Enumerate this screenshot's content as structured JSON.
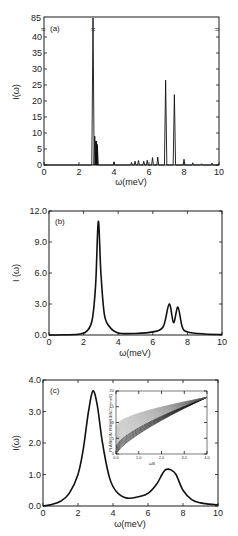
{
  "chart_data": [
    {
      "type": "line",
      "panel": "(a)",
      "xlabel": "ω(meV)",
      "ylabel": "I(ω)",
      "xlim": [
        0,
        10
      ],
      "ylim": [
        0,
        45
      ],
      "y_break": {
        "display_top": "85",
        "break_symbol": "≈",
        "break_at_x": [
          0,
          2.8,
          10
        ]
      },
      "xticks": [
        "0",
        "2",
        "4",
        "6",
        "8",
        "10"
      ],
      "yticks": [
        "0",
        "5",
        "10",
        "15",
        "20",
        "25",
        "30",
        "35",
        "40"
      ],
      "ytick_top_label": "85",
      "grid": false,
      "peaks": [
        {
          "x": 2.8,
          "y": 85
        },
        {
          "x": 2.9,
          "y": 9
        },
        {
          "x": 3.0,
          "y": 7.5
        },
        {
          "x": 3.05,
          "y": 6
        },
        {
          "x": 4.0,
          "y": 1
        },
        {
          "x": 5.0,
          "y": 0.8
        },
        {
          "x": 5.2,
          "y": 1.2
        },
        {
          "x": 5.4,
          "y": 1.4
        },
        {
          "x": 5.7,
          "y": 1.2
        },
        {
          "x": 5.9,
          "y": 1.5
        },
        {
          "x": 6.2,
          "y": 2.3
        },
        {
          "x": 6.5,
          "y": 2.5
        },
        {
          "x": 6.95,
          "y": 26.5
        },
        {
          "x": 7.45,
          "y": 22
        },
        {
          "x": 8.0,
          "y": 1.8
        },
        {
          "x": 8.5,
          "y": 0.7
        },
        {
          "x": 9.0,
          "y": 0.4
        },
        {
          "x": 9.6,
          "y": 0.6
        }
      ]
    },
    {
      "type": "line",
      "panel": "(b)",
      "xlabel": "ω(meV)",
      "ylabel": "I (ω)",
      "xlim": [
        0,
        10
      ],
      "ylim": [
        0,
        12
      ],
      "xticks": [
        "0",
        "2",
        "4",
        "6",
        "8",
        "10"
      ],
      "yticks": [
        "0.0",
        "3.0",
        "6.0",
        "9.0",
        "12.0"
      ],
      "grid": false,
      "x": [
        0,
        1.0,
        1.8,
        2.2,
        2.5,
        2.7,
        2.85,
        3.0,
        3.2,
        3.5,
        4.0,
        5.0,
        6.0,
        6.6,
        6.95,
        7.2,
        7.45,
        7.7,
        8.0,
        9.0,
        10
      ],
      "y": [
        0.0,
        0.02,
        0.1,
        0.4,
        1.5,
        5.0,
        11.0,
        6.0,
        2.0,
        0.8,
        0.2,
        0.15,
        0.3,
        0.8,
        3.0,
        1.2,
        2.7,
        0.8,
        0.3,
        0.1,
        0.05
      ]
    },
    {
      "type": "line",
      "panel": "(c)",
      "xlabel": "ω(meV)",
      "ylabel": "I(ω)",
      "xlim": [
        0,
        10
      ],
      "ylim": [
        0,
        4
      ],
      "xticks": [
        "0",
        "2",
        "4",
        "6",
        "8",
        "10"
      ],
      "yticks": [
        "0.0",
        "1.0",
        "2.0",
        "3.0",
        "4.0"
      ],
      "grid": false,
      "x": [
        0,
        0.5,
        1.0,
        1.5,
        2.0,
        2.3,
        2.6,
        2.85,
        3.1,
        3.4,
        3.8,
        4.2,
        4.8,
        5.5,
        6.0,
        6.5,
        6.8,
        7.0,
        7.3,
        7.6,
        8.0,
        8.5,
        9.0,
        9.5,
        10
      ],
      "y": [
        0.0,
        0.05,
        0.15,
        0.4,
        1.0,
        1.8,
        3.0,
        3.65,
        3.2,
        2.0,
        0.9,
        0.45,
        0.25,
        0.3,
        0.4,
        0.7,
        1.0,
        1.15,
        1.15,
        1.0,
        0.5,
        0.2,
        0.1,
        0.06,
        0.03
      ]
    },
    {
      "type": "line",
      "panel": "(c) inset",
      "xlabel": "ωB",
      "ylabel": "PLASMON FREQUENCY (meV)",
      "xlim": [
        0,
        4
      ],
      "ylim": [
        0,
        20
      ],
      "xticks": [
        "0.0",
        "1.0",
        "2.0",
        "3.0",
        "4.0"
      ],
      "yticks": [
        "0",
        "5",
        "10",
        "15",
        "20"
      ],
      "description": "Family of many curves fanning out from origin, converging to ~18 meV at x=4"
    }
  ],
  "labels": {
    "a": {
      "tag": "(a)",
      "xlabel": "ω(meV)",
      "ylabel": "I(ω)",
      "top": "85",
      "brk": "≈"
    },
    "b": {
      "tag": "(b)",
      "xlabel": "ω(meV)",
      "ylabel": "I (ω)"
    },
    "c": {
      "tag": "(c)",
      "xlabel": "ω(meV)",
      "ylabel": "I(ω)"
    },
    "inset": {
      "ylabel": "PLASMON FREQUENCY (meV)",
      "xlabel": "ωB"
    }
  }
}
